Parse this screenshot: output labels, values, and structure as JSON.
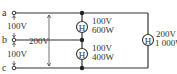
{
  "terminals": [
    {
      "id": "a",
      "label": "a"
    },
    {
      "id": "b",
      "label": "b"
    },
    {
      "id": "c",
      "label": "c"
    }
  ],
  "voltages": {
    "ab": "100V",
    "bc": "100V",
    "ac": "200V"
  },
  "heaters": [
    {
      "symbol": "H",
      "voltage": "100V",
      "power": "600W",
      "between": "a-b"
    },
    {
      "symbol": "H",
      "voltage": "100V",
      "power": "400W",
      "between": "b-c"
    },
    {
      "symbol": "H",
      "voltage": "200V",
      "power": "1 000W",
      "between": "a-c"
    }
  ]
}
